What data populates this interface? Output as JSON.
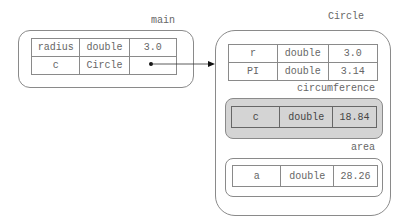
{
  "frames": {
    "main": {
      "label": "main",
      "rows": [
        {
          "name": "radius",
          "type": "double",
          "value": "3.0"
        },
        {
          "name": "c",
          "type": "Circle",
          "value": ""
        }
      ]
    },
    "circle": {
      "label": "Circle",
      "rows": [
        {
          "name": "r",
          "type": "double",
          "value": "3.0"
        },
        {
          "name": "PI",
          "type": "double",
          "value": "3.14"
        }
      ]
    },
    "circumference": {
      "label": "circumference",
      "rows": [
        {
          "name": "c",
          "type": "double",
          "value": "18.84"
        }
      ]
    },
    "area": {
      "label": "area",
      "rows": [
        {
          "name": "a",
          "type": "double",
          "value": "28.26"
        }
      ]
    }
  },
  "colors": {
    "border": "#8a8a8a",
    "shaded_frame": "#d4d4d4",
    "text": "#666666"
  }
}
